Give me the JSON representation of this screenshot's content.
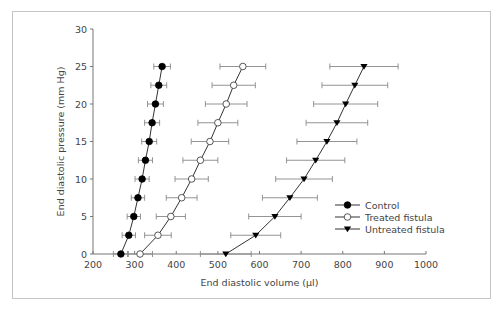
{
  "chart_data": {
    "type": "scatter",
    "title": "",
    "xlabel": "End diastolic volume (µl)",
    "ylabel": "End diastolic pressure (mm Hg)",
    "xlim": [
      200,
      1000
    ],
    "ylim": [
      0,
      30
    ],
    "xticks": [
      200,
      300,
      400,
      500,
      600,
      700,
      800,
      900,
      1000
    ],
    "yticks": [
      0,
      5,
      10,
      15,
      20,
      25,
      30
    ],
    "grid": false,
    "legend_position": "lower right",
    "error_bars": "horizontal",
    "y": [
      0,
      2.5,
      5,
      7.5,
      10,
      12.5,
      15,
      17.5,
      20,
      22.5,
      25
    ],
    "series": [
      {
        "name": "Control",
        "marker": "filled-circle",
        "x": [
          267,
          286,
          298,
          308,
          318,
          326,
          335,
          342,
          350,
          358,
          366
        ],
        "xerr": [
          18,
          16,
          16,
          16,
          17,
          17,
          18,
          18,
          19,
          19,
          20
        ]
      },
      {
        "name": "Treated fistula",
        "marker": "open-circle",
        "x": [
          313,
          356,
          387,
          413,
          437,
          458,
          481,
          500,
          520,
          538,
          560
        ],
        "xerr": [
          30,
          32,
          35,
          37,
          40,
          42,
          45,
          48,
          50,
          52,
          55
        ]
      },
      {
        "name": "Untreated fistula",
        "marker": "filled-triangle-down",
        "x": [
          519,
          591,
          637,
          673,
          707,
          735,
          762,
          786,
          807,
          829,
          851
        ],
        "xerr": [
          61,
          60,
          63,
          66,
          68,
          70,
          72,
          74,
          77,
          79,
          82
        ]
      }
    ]
  },
  "labels": {
    "xlabel": "End diastolic volume (µl)",
    "ylabel": "End diastolic pressure (mm Hg)",
    "legend": [
      "Control",
      "Treated fistula",
      "Untreated fistula"
    ]
  }
}
